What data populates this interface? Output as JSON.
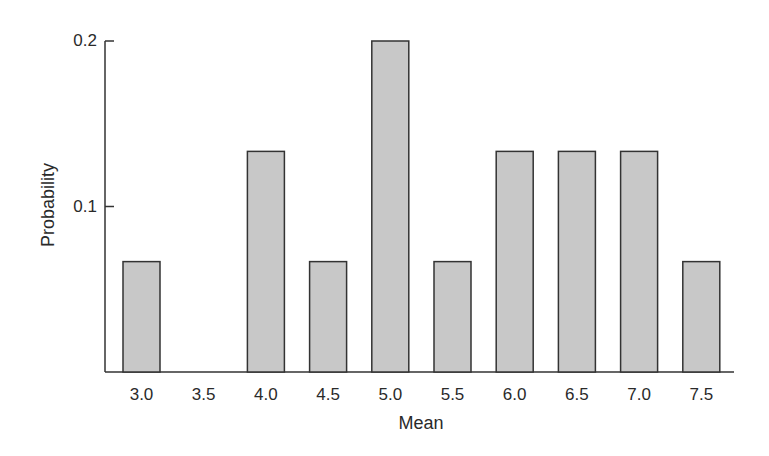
{
  "chart_data": {
    "type": "bar",
    "title": "",
    "xlabel": "Mean",
    "ylabel": "Probability",
    "categories": [
      "3.0",
      "3.5",
      "4.0",
      "4.5",
      "5.0",
      "5.5",
      "6.0",
      "6.5",
      "7.0",
      "7.5"
    ],
    "values": [
      0.0667,
      0,
      0.1333,
      0.0667,
      0.2,
      0.0667,
      0.1333,
      0.1333,
      0.1333,
      0.0667
    ],
    "yticks": [
      "0.1",
      "0.2"
    ],
    "ytick_values": [
      0.1,
      0.2
    ],
    "ylim": [
      0,
      0.2
    ],
    "grid": false,
    "legend": null
  },
  "style": {
    "bar_fill": "#c8c8c8",
    "bar_stroke": "#333333",
    "axis_color": "#333333"
  }
}
